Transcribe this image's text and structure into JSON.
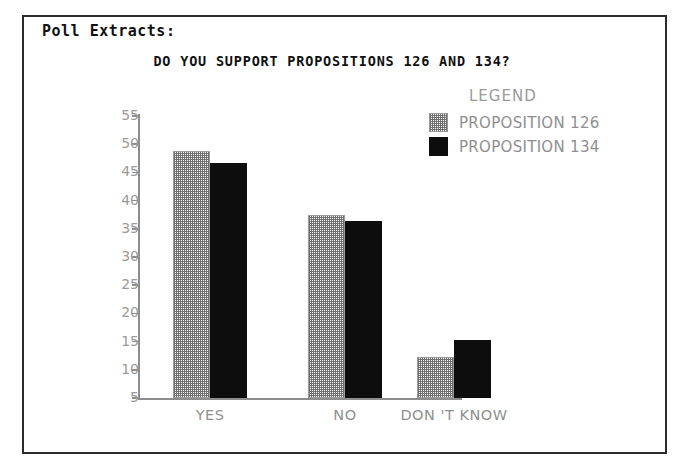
{
  "document": {
    "heading": "Poll Extracts:",
    "frame_color": "#2b2b2b",
    "background": "#ffffff"
  },
  "legend": {
    "title": "LEGEND",
    "entries": [
      {
        "label": "PROPOSITION 126",
        "swatch": "hatched-gray-swatch",
        "color": "#6f6f6f"
      },
      {
        "label": "PROPOSITION 134",
        "swatch": "solid-black-swatch",
        "color": "#0d0d0d"
      }
    ]
  },
  "chart_data": {
    "type": "bar",
    "title": "DO YOU SUPPORT PROPOSITIONS 126 AND 134?",
    "xlabel": "",
    "ylabel": "",
    "categories": [
      "YES",
      "NO",
      "DON 'T KNOW"
    ],
    "series": [
      {
        "name": "PROPOSITION 126",
        "values": [
          48.8,
          37.5,
          12.3
        ],
        "fill": "hatched",
        "color": "#6f6f6f"
      },
      {
        "name": "PROPOSITION 134",
        "values": [
          46.7,
          36.4,
          15.2
        ],
        "fill": "solid",
        "color": "#0d0d0d"
      }
    ],
    "ylim": [
      5,
      55
    ],
    "yticks": [
      55,
      50,
      45,
      40,
      35,
      30,
      25,
      20,
      15,
      10,
      5
    ],
    "ytick_labels": [
      "55",
      "50",
      "45",
      "40",
      "35",
      "30",
      "25",
      "20",
      "15",
      "10",
      "5"
    ],
    "grid": false,
    "legend_position": "top-right",
    "axis_color": "#8d8d8d",
    "tick_label_color": "#9a9a9a"
  }
}
